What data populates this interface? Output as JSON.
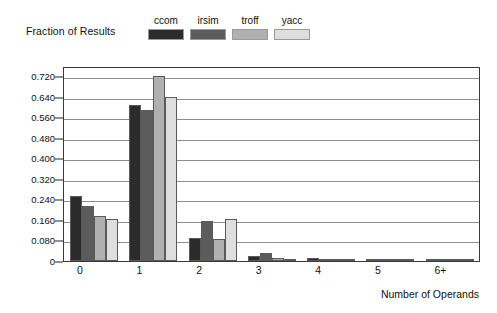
{
  "chart_data": {
    "type": "bar",
    "title": "",
    "subtitle": "",
    "xlabel": "Number of Operands",
    "ylabel": "Fraction of Results",
    "categories": [
      "0",
      "1",
      "2",
      "3",
      "4",
      "5",
      "6+"
    ],
    "series": [
      {
        "name": "ccom",
        "color": "#2b2b2b",
        "values": [
          0.255,
          0.61,
          0.09,
          0.02,
          0.01,
          0.002,
          0.001
        ]
      },
      {
        "name": "irsim",
        "color": "#5c5c5c",
        "values": [
          0.215,
          0.59,
          0.155,
          0.032,
          0.008,
          0.002,
          0.001
        ]
      },
      {
        "name": "troff",
        "color": "#b0b0b0",
        "values": [
          0.175,
          0.72,
          0.085,
          0.013,
          0.003,
          0.001,
          0.001
        ]
      },
      {
        "name": "yacc",
        "color": "#dedede",
        "values": [
          0.165,
          0.64,
          0.165,
          0.008,
          0.003,
          0.001,
          0.001
        ]
      }
    ],
    "yticks": [
      "0",
      "0.080",
      "0.160",
      "0.240",
      "0.320",
      "0.400",
      "0.480",
      "0.560",
      "0.640",
      "0.720"
    ],
    "ytickvalues": [
      0,
      0.08,
      0.16,
      0.24,
      0.32,
      0.4,
      0.48,
      0.56,
      0.64,
      0.72
    ],
    "ylim": [
      0,
      0.76
    ],
    "grid": true,
    "legend_position": "top",
    "legend": [
      "ccom",
      "irsim",
      "troff",
      "yacc"
    ]
  },
  "axis": {
    "y_title": "Fraction of Results",
    "x_title": "Number of Operands"
  }
}
